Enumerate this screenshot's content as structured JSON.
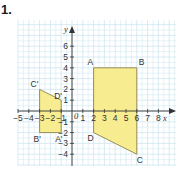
{
  "question_number": "1.",
  "axes": {
    "x_label": "x",
    "y_label": "y",
    "origin_label": "0",
    "x_ticks": [
      "-5",
      "-4",
      "-3",
      "-2",
      "-1",
      "1",
      "2",
      "3",
      "4",
      "5",
      "6",
      "7",
      "8"
    ],
    "y_ticks": [
      "6",
      "5",
      "4",
      "3",
      "2",
      "1",
      "-1",
      "-2",
      "-3",
      "-4"
    ],
    "x_range": [
      -5,
      8
    ],
    "y_range": [
      -4,
      6
    ]
  },
  "colors": {
    "shape_fill": "#f7ec8f",
    "shape_stroke": "#8a8550",
    "grid": "#cfe6ef",
    "axis": "#333333"
  },
  "shapes": [
    {
      "name": "ABCD",
      "vertices": [
        {
          "label": "A",
          "x": 2,
          "y": 4
        },
        {
          "label": "B",
          "x": 6,
          "y": 4
        },
        {
          "label": "C",
          "x": 6,
          "y": -4
        },
        {
          "label": "D",
          "x": 2,
          "y": -2
        }
      ]
    },
    {
      "name": "A'B'C'D'",
      "vertices": [
        {
          "label": "A'",
          "x": -1,
          "y": -2
        },
        {
          "label": "B'",
          "x": -3,
          "y": -2
        },
        {
          "label": "C'",
          "x": -3,
          "y": 2
        },
        {
          "label": "D'",
          "x": -1,
          "y": 1
        }
      ]
    }
  ]
}
